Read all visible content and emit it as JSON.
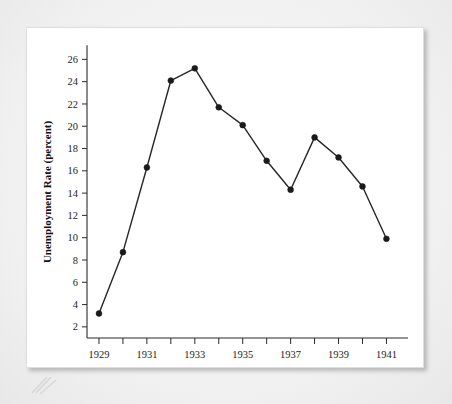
{
  "figure": {
    "background_color": "#f1f1f1",
    "card_color": "#ffffff",
    "line_color": "#262626",
    "marker_color": "#1a1a1a"
  },
  "chart_data": {
    "type": "line",
    "title": "",
    "xlabel": "",
    "ylabel": "Unemployment Rate (percent)",
    "x": [
      1929,
      1930,
      1931,
      1932,
      1933,
      1934,
      1935,
      1936,
      1937,
      1938,
      1939,
      1940,
      1941
    ],
    "values": [
      3.2,
      8.7,
      16.3,
      24.1,
      25.2,
      21.7,
      20.1,
      16.9,
      14.3,
      19.0,
      17.2,
      14.6,
      9.9
    ],
    "series": [
      {
        "name": "Unemployment Rate",
        "values": [
          3.2,
          8.7,
          16.3,
          24.1,
          25.2,
          21.7,
          20.1,
          16.9,
          14.3,
          19.0,
          17.2,
          14.6,
          9.9
        ]
      }
    ],
    "xlim": [
      1928.5,
      1941.9
    ],
    "ylim": [
      1.0,
      27.2
    ],
    "x_tick_values": [
      1929,
      1930,
      1931,
      1932,
      1933,
      1934,
      1935,
      1936,
      1937,
      1938,
      1939,
      1940,
      1941
    ],
    "x_tick_labels": [
      "1929",
      "",
      "1931",
      "",
      "1933",
      "",
      "1935",
      "",
      "1937",
      "",
      "1939",
      "",
      "1941"
    ],
    "y_ticks": [
      2,
      4,
      6,
      8,
      10,
      12,
      14,
      16,
      18,
      20,
      22,
      24,
      26
    ],
    "y_tick_labels": [
      "2",
      "4",
      "6",
      "8",
      "10",
      "12",
      "14",
      "16",
      "18",
      "20",
      "22",
      "24",
      "26"
    ],
    "grid": false,
    "legend": false,
    "markers": "filled-circle"
  }
}
